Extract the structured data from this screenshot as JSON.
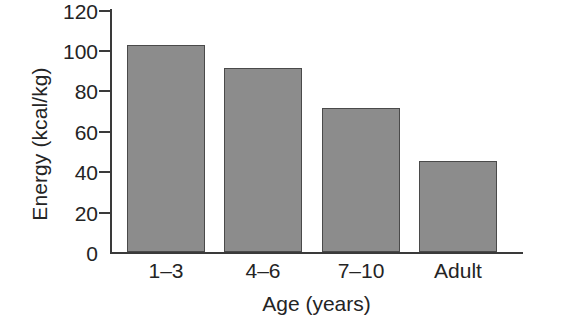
{
  "chart_data": {
    "type": "bar",
    "title": "",
    "xlabel": "Age (years)",
    "ylabel": "Energy (kcal/kg)",
    "categories": [
      "1–3",
      "4–6",
      "7–10",
      "Adult"
    ],
    "values": [
      102,
      91,
      71,
      45
    ],
    "ylim": [
      0,
      120
    ],
    "yticks": [
      120,
      100,
      80,
      60,
      40,
      20,
      0
    ],
    "ytick_labels": [
      "120",
      "100",
      "80",
      "60",
      "40",
      "20",
      "0"
    ],
    "grid": false,
    "legend": null,
    "bar_color": "#8c8c8c",
    "bar_edge_color": "#4a4a4a",
    "axis_color": "#3a3a3a",
    "background": "#ffffff"
  },
  "adjacent_panel": {
    "ylabel": "Protein (g/kg)",
    "note_cropped": "partially visible at right edge"
  }
}
